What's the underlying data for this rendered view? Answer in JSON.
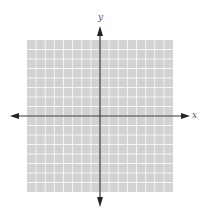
{
  "diagram": {
    "type": "coordinate-plane",
    "x_axis_label": "x",
    "y_axis_label": "y",
    "grid": {
      "columns": 16,
      "rows": 16,
      "background_color": "#d2d2d2",
      "line_color": "#f4f4f4"
    },
    "axis_color": "#333333"
  }
}
